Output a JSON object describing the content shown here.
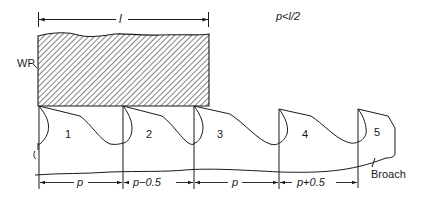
{
  "diagram": {
    "workpiece": {
      "label": "WP",
      "length_label": "l"
    },
    "condition": "p<l/2",
    "broach": {
      "label": "Broach",
      "teeth": [
        {
          "number": "1"
        },
        {
          "number": "2"
        },
        {
          "number": "3"
        },
        {
          "number": "4"
        },
        {
          "number": "5"
        }
      ]
    },
    "pitch_dimensions": [
      {
        "label": "p"
      },
      {
        "label": "p−0.5"
      },
      {
        "label": "p"
      },
      {
        "label": "p+0.5"
      }
    ]
  },
  "colors": {
    "line": "#1a1a1a",
    "background": "#ffffff"
  }
}
